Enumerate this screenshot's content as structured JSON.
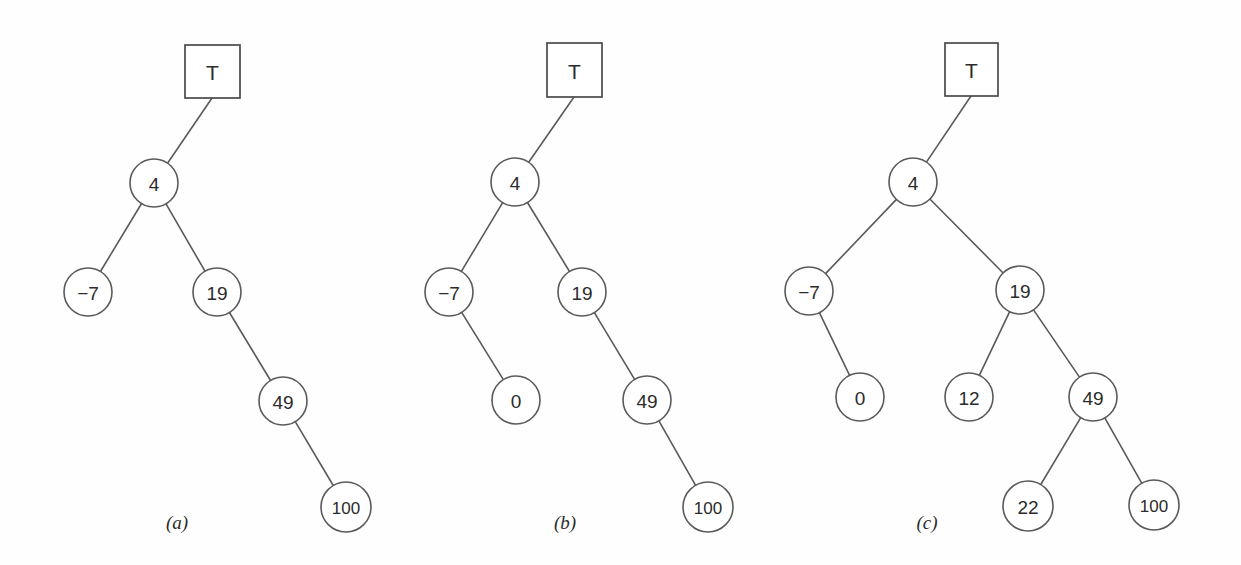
{
  "figure": {
    "background_color": "#fefefe",
    "stroke_color": "#5a5a5a",
    "text_color": "#2b2b2b",
    "width": 1241,
    "height": 565
  },
  "chart_data": {
    "type": "diagram",
    "subtype": "binary-search-tree",
    "panels": [
      {
        "id": "a",
        "caption": "(a)",
        "caption_x": 177,
        "caption_y": 522,
        "root_pointer": {
          "label": "T",
          "shape": "rect",
          "x": 185,
          "y": 45,
          "w": 55,
          "h": 53,
          "anchor_x": 212,
          "anchor_y": 98
        },
        "nodes": [
          {
            "id": "a4",
            "label": "4",
            "cx": 154,
            "cy": 183,
            "r": 24
          },
          {
            "id": "am7",
            "label": "−7",
            "cx": 88,
            "cy": 292,
            "r": 24
          },
          {
            "id": "a19",
            "label": "19",
            "cx": 217,
            "cy": 292,
            "r": 24
          },
          {
            "id": "a49",
            "label": "49",
            "cx": 283,
            "cy": 401,
            "r": 24
          },
          {
            "id": "a100",
            "label": "100",
            "cx": 346,
            "cy": 507,
            "r": 25
          }
        ],
        "edges": [
          {
            "from": "root",
            "to": "a4"
          },
          {
            "from": "a4",
            "to": "am7"
          },
          {
            "from": "a4",
            "to": "a19"
          },
          {
            "from": "a19",
            "to": "a49"
          },
          {
            "from": "a49",
            "to": "a100"
          }
        ]
      },
      {
        "id": "b",
        "caption": "(b)",
        "caption_x": 565,
        "caption_y": 522,
        "root_pointer": {
          "label": "T",
          "shape": "rect",
          "x": 547,
          "y": 43,
          "w": 55,
          "h": 54,
          "anchor_x": 574,
          "anchor_y": 97
        },
        "nodes": [
          {
            "id": "b4",
            "label": "4",
            "cx": 515,
            "cy": 182,
            "r": 24
          },
          {
            "id": "bm7",
            "label": "−7",
            "cx": 449,
            "cy": 292,
            "r": 24
          },
          {
            "id": "b19",
            "label": "19",
            "cx": 582,
            "cy": 292,
            "r": 24
          },
          {
            "id": "b0",
            "label": "0",
            "cx": 516,
            "cy": 400,
            "r": 24
          },
          {
            "id": "b49",
            "label": "49",
            "cx": 647,
            "cy": 400,
            "r": 24
          },
          {
            "id": "b100",
            "label": "100",
            "cx": 708,
            "cy": 507,
            "r": 25
          }
        ],
        "edges": [
          {
            "from": "root",
            "to": "b4"
          },
          {
            "from": "b4",
            "to": "bm7"
          },
          {
            "from": "b4",
            "to": "b19"
          },
          {
            "from": "bm7",
            "to": "b0"
          },
          {
            "from": "b19",
            "to": "b49"
          },
          {
            "from": "b49",
            "to": "b100"
          }
        ]
      },
      {
        "id": "c",
        "caption": "(c)",
        "caption_x": 927,
        "caption_y": 522,
        "root_pointer": {
          "label": "T",
          "shape": "rect",
          "x": 945,
          "y": 43,
          "w": 53,
          "h": 53,
          "anchor_x": 971,
          "anchor_y": 96
        },
        "nodes": [
          {
            "id": "c4",
            "label": "4",
            "cx": 913,
            "cy": 182,
            "r": 24
          },
          {
            "id": "cm7",
            "label": "−7",
            "cx": 809,
            "cy": 291,
            "r": 24
          },
          {
            "id": "c19",
            "label": "19",
            "cx": 1020,
            "cy": 290,
            "r": 24
          },
          {
            "id": "c0",
            "label": "0",
            "cx": 860,
            "cy": 397,
            "r": 24
          },
          {
            "id": "c12",
            "label": "12",
            "cx": 969,
            "cy": 397,
            "r": 24
          },
          {
            "id": "c49",
            "label": "49",
            "cx": 1093,
            "cy": 397,
            "r": 24
          },
          {
            "id": "c22",
            "label": "22",
            "cx": 1028,
            "cy": 506,
            "r": 25
          },
          {
            "id": "c100",
            "label": "100",
            "cx": 1154,
            "cy": 505,
            "r": 25
          }
        ],
        "edges": [
          {
            "from": "root",
            "to": "c4"
          },
          {
            "from": "c4",
            "to": "cm7"
          },
          {
            "from": "c4",
            "to": "c19"
          },
          {
            "from": "cm7",
            "to": "c0"
          },
          {
            "from": "c19",
            "to": "c12"
          },
          {
            "from": "c19",
            "to": "c49"
          },
          {
            "from": "c49",
            "to": "c22"
          },
          {
            "from": "c49",
            "to": "c100"
          }
        ]
      }
    ]
  }
}
